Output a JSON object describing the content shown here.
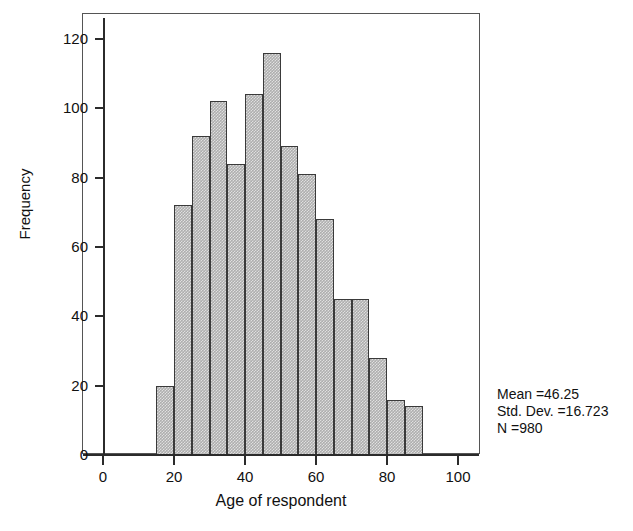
{
  "chart_data": {
    "type": "bar",
    "title": "",
    "subtitle": "",
    "xlabel": "Age of respondent",
    "ylabel": "Frequency",
    "xlim": [
      0,
      105
    ],
    "ylim": [
      0,
      126
    ],
    "xticks": [
      0,
      20,
      40,
      60,
      80,
      100
    ],
    "yticks": [
      0,
      20,
      40,
      60,
      80,
      100,
      120
    ],
    "grid": false,
    "legend": null,
    "bin_width": 5,
    "bin_starts": [
      15,
      20,
      25,
      30,
      35,
      40,
      45,
      50,
      55,
      60,
      65,
      70,
      75,
      80,
      85
    ],
    "categories": [
      "15-20",
      "20-25",
      "25-30",
      "30-35",
      "35-40",
      "40-45",
      "45-50",
      "50-55",
      "55-60",
      "60-65",
      "65-70",
      "70-75",
      "75-80",
      "80-85",
      "85-90"
    ],
    "values": [
      20,
      72,
      92,
      102,
      84,
      104,
      116,
      89,
      81,
      68,
      45,
      45,
      28,
      16,
      14
    ],
    "annotations": {
      "mean_label": "Mean =46.25",
      "std_label": "Std. Dev. =16.723",
      "n_label": "N =980"
    },
    "colors": {
      "bar_fill": "#aeaeae",
      "bar_border": "#3a3a3a",
      "axis": "#2b2b2b",
      "frame": "#555555",
      "text": "#111111",
      "background": "#ffffff"
    }
  },
  "axis": {
    "y_title": "Frequency",
    "x_title": "Age of respondent",
    "y_tick_labels": [
      "0",
      "20",
      "40",
      "60",
      "80",
      "100",
      "120"
    ],
    "x_tick_labels": [
      "0",
      "20",
      "40",
      "60",
      "80",
      "100"
    ]
  },
  "stats": {
    "mean": "Mean =46.25",
    "std_dev": "Std. Dev. =16.723",
    "n": "N =980"
  }
}
